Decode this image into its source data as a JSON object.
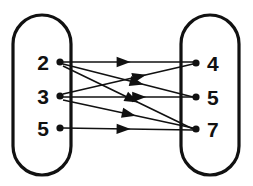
{
  "diagram": {
    "type": "mapping-diagram",
    "title": "",
    "domain_set": {
      "name": "left-oval",
      "elements": [
        {
          "label": "2",
          "x": 60,
          "y": 62
        },
        {
          "label": "3",
          "x": 60,
          "y": 96
        },
        {
          "label": "5",
          "x": 60,
          "y": 128
        }
      ],
      "shape": {
        "x": 13,
        "y": 15,
        "width": 58,
        "height": 160,
        "rx": 29
      }
    },
    "codomain_set": {
      "name": "right-oval",
      "elements": [
        {
          "label": "4",
          "x": 196,
          "y": 63
        },
        {
          "label": "5",
          "x": 196,
          "y": 97
        },
        {
          "label": "7",
          "x": 196,
          "y": 129
        }
      ],
      "shape": {
        "x": 181,
        "y": 15,
        "width": 58,
        "height": 160,
        "rx": 29
      }
    },
    "edges": [
      {
        "from": "2",
        "to": "4",
        "x1": 63,
        "y1": 62,
        "x2": 193,
        "y2": 62,
        "arrow_t": 0.52
      },
      {
        "from": "2",
        "to": "5",
        "x1": 63,
        "y1": 64,
        "x2": 193,
        "y2": 97,
        "arrow_t": 0.62
      },
      {
        "from": "2",
        "to": "7",
        "x1": 63,
        "y1": 66,
        "x2": 193,
        "y2": 129,
        "arrow_t": 0.58
      },
      {
        "from": "3",
        "to": "4",
        "x1": 63,
        "y1": 94,
        "x2": 193,
        "y2": 64,
        "arrow_t": 0.64
      },
      {
        "from": "3",
        "to": "5",
        "x1": 63,
        "y1": 97,
        "x2": 193,
        "y2": 97,
        "arrow_t": 0.64
      },
      {
        "from": "3",
        "to": "7",
        "x1": 63,
        "y1": 100,
        "x2": 193,
        "y2": 128,
        "arrow_t": 0.56
      },
      {
        "from": "5",
        "to": "7",
        "x1": 63,
        "y1": 128,
        "x2": 193,
        "y2": 130,
        "arrow_t": 0.52
      }
    ],
    "colors": {
      "stroke": "#111111",
      "background": "#ffffff",
      "node_fill": "#111111"
    },
    "labels": {
      "left": [
        "2",
        "3",
        "5"
      ],
      "right": [
        "4",
        "5",
        "7"
      ]
    }
  }
}
